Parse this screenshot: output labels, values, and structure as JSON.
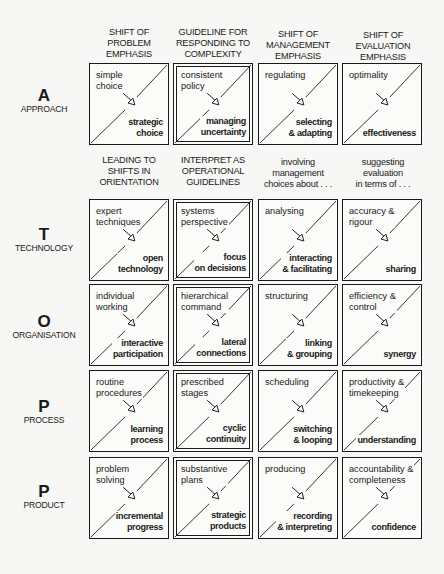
{
  "column_headers": [
    "SHIFT OF\nPROBLEM\nEMPHASIS",
    "GUIDELINE FOR\nRESPONDING TO\nCOMPLEXITY",
    "SHIFT OF\nMANAGEMENT\nEMPHASIS",
    "SHIFT OF\nEVALUATION\nEMPHASIS"
  ],
  "subheaders": [
    "LEADING TO\nSHIFTS IN\nORIENTATION",
    "INTERPRET AS\nOPERATIONAL\nGUIDELINES",
    "involving\nmanagement\nchoices about . . .",
    "suggesting\nevaluation\nin terms of . . ."
  ],
  "rows": [
    {
      "letter": "A",
      "label": "APPROACH",
      "cells": [
        {
          "from": "simple\nchoice",
          "to": "strategic\nchoice"
        },
        {
          "from": "consistent\npolicy",
          "to": "managing\nuncertainty"
        },
        {
          "from": "regulating",
          "to": "selecting\n& adapting"
        },
        {
          "from": "optimality",
          "to": "effectiveness"
        }
      ]
    },
    {
      "letter": "T",
      "label": "TECHNOLOGY",
      "cells": [
        {
          "from": "expert\ntechniques",
          "to": "open\ntechnology"
        },
        {
          "from": "systems\nperspective",
          "to": "focus\non decisions"
        },
        {
          "from": "analysing",
          "to": "interacting\n& facilitating"
        },
        {
          "from": "accuracy &\nrigour",
          "to": "sharing"
        }
      ]
    },
    {
      "letter": "O",
      "label": "ORGANISATION",
      "cells": [
        {
          "from": "individual\nworking",
          "to": "interactive\nparticipation"
        },
        {
          "from": "hierarchical\ncommand",
          "to": "lateral\nconnections"
        },
        {
          "from": "structuring",
          "to": "linking\n& grouping"
        },
        {
          "from": "efficiency &\ncontrol",
          "to": "synergy"
        }
      ]
    },
    {
      "letter": "P",
      "label": "PROCESS",
      "cells": [
        {
          "from": "routine\nprocedures",
          "to": "learning\nprocess"
        },
        {
          "from": "prescribed\nstages",
          "to": "cyclic\ncontinuity"
        },
        {
          "from": "scheduling",
          "to": "switching\n& looping"
        },
        {
          "from": "productivity &\ntimekeeping",
          "to": "understanding"
        }
      ]
    },
    {
      "letter": "P",
      "label": "PRODUCT",
      "cells": [
        {
          "from": "problem\nsolving",
          "to": "incremental\nprogress"
        },
        {
          "from": "substantive\nplans",
          "to": "strategic\nproducts"
        },
        {
          "from": "producing",
          "to": "recording\n& interpreting"
        },
        {
          "from": "accountability &\ncompleteness",
          "to": "confidence"
        }
      ]
    }
  ],
  "layout": {
    "col_x": [
      89,
      173,
      258,
      342
    ],
    "row_y": [
      63,
      199,
      284,
      370,
      457
    ],
    "double_border_column": 1,
    "ink_color": "#1a1a1a",
    "paper_color": "#f7f7f5"
  }
}
